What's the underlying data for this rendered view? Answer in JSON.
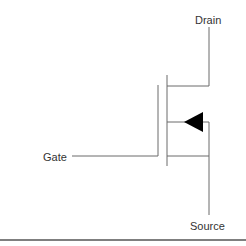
{
  "diagram": {
    "type": "MOSFET symbol (N-channel enhancement)",
    "labels": {
      "drain": "Drain",
      "gate": "Gate",
      "source": "Source"
    },
    "colors": {
      "line": "#6b6b6b",
      "arrow": "#000000",
      "text": "#333333",
      "rule": "#555555",
      "background": "#ffffff"
    }
  }
}
